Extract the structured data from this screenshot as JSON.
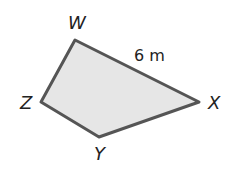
{
  "figure": {
    "shape": "quadrilateral",
    "fill_color": "#e6e6e6",
    "stroke_color": "#555555",
    "vertices": [
      {
        "name": "W"
      },
      {
        "name": "X"
      },
      {
        "name": "Y"
      },
      {
        "name": "Z"
      }
    ],
    "side_label": {
      "side": "WX",
      "text": "6 m"
    }
  }
}
